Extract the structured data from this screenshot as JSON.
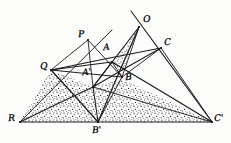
{
  "figure": {
    "style": {
      "ink_color": "#1a1a1c",
      "paper_color": "#fdfdfc",
      "stipple_color": "#2a2a2c",
      "line_width": 1.0
    },
    "points": [
      {
        "id": "P",
        "label": "P",
        "x": 88,
        "y": 40,
        "label_x": 78,
        "label_y": 30
      },
      {
        "id": "O",
        "label": "O",
        "x": 139,
        "y": 27,
        "label_x": 143,
        "label_y": 15
      },
      {
        "id": "C",
        "label": "C",
        "x": 161,
        "y": 48,
        "label_x": 164,
        "label_y": 38
      },
      {
        "id": "Q",
        "label": "Q",
        "x": 51,
        "y": 70,
        "label_x": 40,
        "label_y": 62
      },
      {
        "id": "A",
        "label": "A",
        "x": 112,
        "y": 62,
        "label_x": 103,
        "label_y": 43
      },
      {
        "id": "B",
        "label": "B",
        "x": 122,
        "y": 77,
        "label_x": 125,
        "label_y": 73
      },
      {
        "id": "A1",
        "label": "A'",
        "x": 93,
        "y": 87,
        "label_x": 82,
        "label_y": 68
      },
      {
        "id": "R",
        "label": "R",
        "x": 20,
        "y": 122,
        "label_x": 8,
        "label_y": 114
      },
      {
        "id": "B1",
        "label": "B'",
        "x": 98,
        "y": 122,
        "label_x": 92,
        "label_y": 126
      },
      {
        "id": "C1",
        "label": "C'",
        "x": 212,
        "y": 122,
        "label_x": 214,
        "label_y": 114
      }
    ],
    "segments": [
      {
        "name": "base-line-R-C1",
        "from": [
          20,
          122
        ],
        "to": [
          212,
          122
        ]
      },
      {
        "name": "ray-R-through-P",
        "from": [
          20,
          122
        ],
        "to": [
          112,
          30
        ]
      },
      {
        "name": "ray-O-through-C1",
        "from": [
          131,
          11
        ],
        "to": [
          212,
          122
        ]
      },
      {
        "name": "line-Q-to-C",
        "from": [
          51,
          70
        ],
        "to": [
          161,
          48
        ]
      },
      {
        "name": "line-Q-to-B",
        "from": [
          51,
          70
        ],
        "to": [
          122,
          77
        ]
      },
      {
        "name": "line-Q-to-A",
        "from": [
          51,
          70
        ],
        "to": [
          112,
          62
        ]
      },
      {
        "name": "line-P-to-A1",
        "from": [
          88,
          40
        ],
        "to": [
          93,
          87
        ]
      },
      {
        "name": "line-P-to-B",
        "from": [
          88,
          40
        ],
        "to": [
          122,
          77
        ]
      },
      {
        "name": "line-P-to-Q",
        "from": [
          88,
          40
        ],
        "to": [
          51,
          70
        ]
      },
      {
        "name": "line-O-to-A1",
        "from": [
          139,
          27
        ],
        "to": [
          93,
          87
        ]
      },
      {
        "name": "line-O-to-B",
        "from": [
          139,
          27
        ],
        "to": [
          122,
          77
        ]
      },
      {
        "name": "line-O-to-B1",
        "from": [
          139,
          27
        ],
        "to": [
          98,
          122
        ]
      },
      {
        "name": "line-A1-to-C",
        "from": [
          93,
          87
        ],
        "to": [
          161,
          48
        ]
      },
      {
        "name": "line-A1-to-C1",
        "from": [
          93,
          87
        ],
        "to": [
          212,
          122
        ]
      },
      {
        "name": "line-A1-to-B1",
        "from": [
          93,
          87
        ],
        "to": [
          98,
          122
        ]
      },
      {
        "name": "line-A-to-B",
        "from": [
          112,
          62
        ],
        "to": [
          122,
          77
        ]
      },
      {
        "name": "line-A-to-C1",
        "from": [
          112,
          62
        ],
        "to": [
          212,
          122
        ]
      },
      {
        "name": "line-B-to-C",
        "from": [
          122,
          77
        ],
        "to": [
          161,
          48
        ]
      },
      {
        "name": "line-B-to-B1",
        "from": [
          122,
          77
        ],
        "to": [
          98,
          122
        ]
      },
      {
        "name": "line-R-to-A1-extended",
        "from": [
          20,
          122
        ],
        "to": [
          93,
          87
        ]
      },
      {
        "name": "line-C-to-C1",
        "from": [
          161,
          48
        ],
        "to": [
          212,
          122
        ]
      },
      {
        "name": "line-Q-to-B1",
        "from": [
          51,
          70
        ],
        "to": [
          98,
          122
        ]
      },
      {
        "name": "line-A1-to-A",
        "from": [
          93,
          87
        ],
        "to": [
          112,
          62
        ]
      }
    ],
    "shaded_regions": [
      {
        "name": "stipple-left-R-Q-A1-B1",
        "polygon": "20,122 51,70 93,87 98,122"
      },
      {
        "name": "stipple-lower-B1-A1-C1",
        "polygon": "98,122 93,87 122,79 212,122"
      },
      {
        "name": "stipple-sliver-O-A-B",
        "polygon": "138,29 113,63 122,78"
      }
    ]
  }
}
